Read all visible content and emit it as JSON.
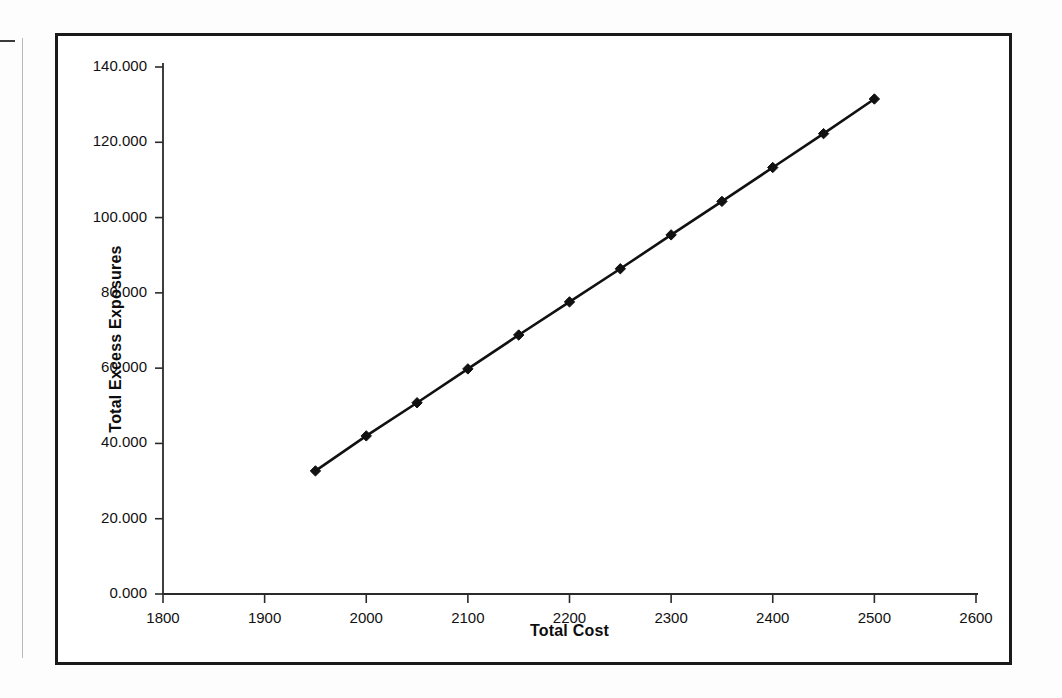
{
  "chart_data": {
    "type": "line",
    "title": "",
    "xlabel": "Total Cost",
    "ylabel": "Total Excess Exposures",
    "xlim": [
      1800,
      2600
    ],
    "ylim": [
      0,
      140
    ],
    "grid": false,
    "legend": false,
    "marker": "diamond",
    "line_color": "#111111",
    "marker_color": "#111111",
    "x_ticks": [
      1800,
      1900,
      2000,
      2100,
      2200,
      2300,
      2400,
      2500,
      2600
    ],
    "x_tick_labels": [
      "1800",
      "1900",
      "2000",
      "2100",
      "2200",
      "2300",
      "2400",
      "2500",
      "2600"
    ],
    "y_ticks": [
      0,
      20,
      40,
      60,
      80,
      100,
      120,
      140
    ],
    "y_tick_labels": [
      "0.000",
      "20.000",
      "40.000",
      "60.000",
      "80.000",
      "100.000",
      "120.000",
      "140.000"
    ],
    "series": [
      {
        "name": "Total Excess Exposures",
        "x": [
          1950,
          2000,
          2050,
          2100,
          2150,
          2200,
          2250,
          2300,
          2350,
          2400,
          2450,
          2500
        ],
        "values": [
          32.7,
          42.0,
          50.8,
          59.8,
          68.8,
          77.6,
          86.4,
          95.4,
          104.3,
          113.3,
          122.3,
          131.5
        ]
      }
    ]
  },
  "figure": {
    "frame_color": "#1a1a1a",
    "background": "#ffffff"
  }
}
